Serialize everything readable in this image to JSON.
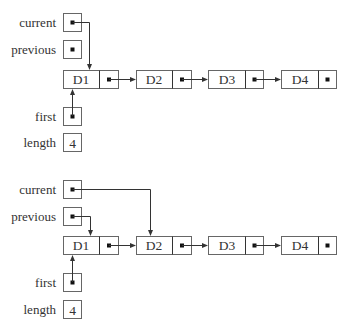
{
  "colors": {
    "background": "#ffffff",
    "box_stroke": "#666666",
    "line": "#333333",
    "text": "#333333",
    "pointer_dot": "#111111"
  },
  "diagrams": [
    {
      "id": "before",
      "labels": {
        "current": "current",
        "previous": "previous",
        "first": "first",
        "length": "length"
      },
      "length_value": "4",
      "nodes": [
        {
          "data": "D1",
          "next": "D2"
        },
        {
          "data": "D2",
          "next": "D3"
        },
        {
          "data": "D3",
          "next": "D4"
        },
        {
          "data": "D4",
          "next": "null"
        }
      ],
      "pointers": {
        "current": "D1",
        "previous": "null",
        "first": "D1"
      }
    },
    {
      "id": "after",
      "labels": {
        "current": "current",
        "previous": "previous",
        "first": "first",
        "length": "length"
      },
      "length_value": "4",
      "nodes": [
        {
          "data": "D1",
          "next": "D2"
        },
        {
          "data": "D2",
          "next": "D3"
        },
        {
          "data": "D3",
          "next": "D4"
        },
        {
          "data": "D4",
          "next": "null"
        }
      ],
      "pointers": {
        "current": "D2",
        "previous": "D1",
        "first": "D1"
      }
    }
  ]
}
